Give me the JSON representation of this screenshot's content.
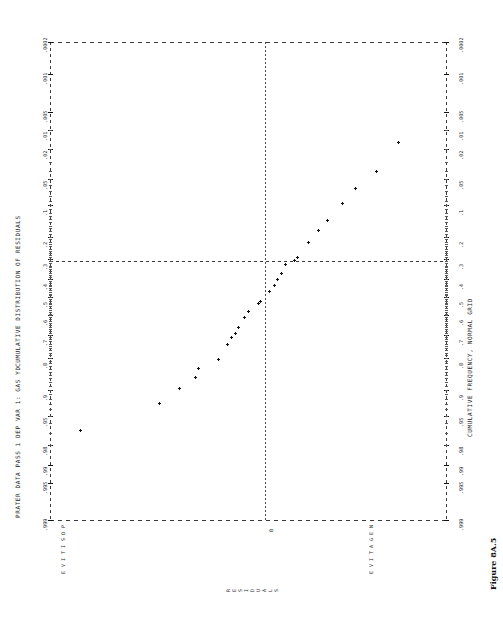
{
  "page": {
    "orientation": "landscape-rotated-90",
    "background": "#ffffff",
    "ink": "#222222"
  },
  "header": {
    "left_title": "PRATER DATA PASS 1   DEP VAR 1: GAS YD",
    "plot_title": "CUMULATIVE DISTRIBUTION OF RESIDUALS",
    "bottom_axis_title": "CUMULATIVE FREQUENCY, NORMAL GRID",
    "figure_caption": "Figure 8A.5"
  },
  "labels": {
    "value_axis_title": "RESIDUALS",
    "positive": "POSITIVE",
    "negative": "NEGATIVE",
    "zero": "0"
  },
  "chart_data": {
    "type": "scatter",
    "title": "CUMULATIVE DISTRIBUTION OF RESIDUALS",
    "subtitle": "PRATER DATA PASS 1   DEP VAR 1: GAS YD",
    "xlabel": "CUMULATIVE FREQUENCY, NORMAL GRID",
    "ylabel": "RESIDUALS",
    "grid": "normal-probability",
    "legend": "none",
    "marker": "plus",
    "xticks": [
      ".0002",
      ".001",
      ".005",
      ".01",
      ".02",
      ".05",
      ".1",
      ".2",
      ".3",
      ".4",
      ".5",
      ".6",
      ".7",
      ".8",
      ".9",
      ".95",
      ".98",
      ".99",
      ".995",
      ".999"
    ],
    "xtick_positions": [
      0.0002,
      0.001,
      0.005,
      0.01,
      0.02,
      0.05,
      0.1,
      0.2,
      0.3,
      0.4,
      0.5,
      0.6,
      0.7,
      0.8,
      0.9,
      0.95,
      0.98,
      0.99,
      0.995,
      0.999
    ],
    "xlim": [
      0.0002,
      0.999
    ],
    "ylim": [
      -1.0,
      1.0
    ],
    "reference_lines": [
      {
        "name": "median-line",
        "axis": "x",
        "value": 0.5,
        "style": "dashed"
      },
      {
        "name": "zero-residual-line",
        "axis": "y",
        "value": 0,
        "style": "dashed"
      }
    ],
    "points": [
      {
        "cum_freq": 0.968,
        "residual": 0.86
      },
      {
        "cum_freq": 0.93,
        "residual": 0.49
      },
      {
        "cum_freq": 0.897,
        "residual": 0.4
      },
      {
        "cum_freq": 0.866,
        "residual": 0.325
      },
      {
        "cum_freq": 0.839,
        "residual": 0.31
      },
      {
        "cum_freq": 0.806,
        "residual": 0.215
      },
      {
        "cum_freq": 0.742,
        "residual": 0.175
      },
      {
        "cum_freq": 0.71,
        "residual": 0.155
      },
      {
        "cum_freq": 0.694,
        "residual": 0.135
      },
      {
        "cum_freq": 0.661,
        "residual": 0.125
      },
      {
        "cum_freq": 0.613,
        "residual": 0.095
      },
      {
        "cum_freq": 0.581,
        "residual": 0.075
      },
      {
        "cum_freq": 0.532,
        "residual": 0.03
      },
      {
        "cum_freq": 0.524,
        "residual": 0.02
      },
      {
        "cum_freq": 0.468,
        "residual": -0.02
      },
      {
        "cum_freq": 0.435,
        "residual": -0.045
      },
      {
        "cum_freq": 0.403,
        "residual": -0.06
      },
      {
        "cum_freq": 0.371,
        "residual": -0.075
      },
      {
        "cum_freq": 0.323,
        "residual": -0.095
      },
      {
        "cum_freq": 0.306,
        "residual": -0.135
      },
      {
        "cum_freq": 0.29,
        "residual": -0.15
      },
      {
        "cum_freq": 0.226,
        "residual": -0.2
      },
      {
        "cum_freq": 0.177,
        "residual": -0.25
      },
      {
        "cum_freq": 0.145,
        "residual": -0.29
      },
      {
        "cum_freq": 0.097,
        "residual": -0.36
      },
      {
        "cum_freq": 0.065,
        "residual": -0.42
      },
      {
        "cum_freq": 0.04,
        "residual": -0.52
      },
      {
        "cum_freq": 0.016,
        "residual": -0.62
      }
    ]
  }
}
